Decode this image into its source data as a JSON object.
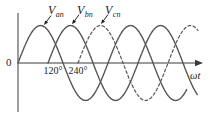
{
  "figure": {
    "background": "#ffffff",
    "origin_label": "0",
    "x_axis_label": "ωt",
    "x_ticks": [
      {
        "label": "120°",
        "theta_deg": 120
      },
      {
        "label": "240°",
        "theta_deg": 240
      }
    ],
    "series_labels": [
      {
        "symbol": "V",
        "subscript": "an"
      },
      {
        "symbol": "V",
        "subscript": "bn"
      },
      {
        "symbol": "V",
        "subscript": "cn"
      }
    ]
  },
  "chart_data": {
    "type": "line",
    "title": "",
    "xlabel": "ωt",
    "ylabel": "",
    "x_unit": "degrees",
    "x_axis_range_deg": [
      0,
      740
    ],
    "y_range": [
      -1,
      1
    ],
    "amplitude": 1,
    "grid": false,
    "x_tick_values_deg": [
      120,
      240
    ],
    "x_tick_labels": [
      "120°",
      "240°"
    ],
    "series": [
      {
        "name": "Van",
        "label": "V_an",
        "value_expression": "sin(wt)",
        "phase_shift_deg": 0,
        "start_deg": 0,
        "end_deg": 675,
        "style": "solid"
      },
      {
        "name": "Vbn",
        "label": "V_bn",
        "value_expression": "sin(wt - 120°)",
        "phase_shift_deg": 120,
        "start_deg": 120,
        "end_deg": 718,
        "style": "solid"
      },
      {
        "name": "Vcn",
        "label": "V_cn",
        "value_expression": "sin(wt - 240°)",
        "phase_shift_deg": 240,
        "start_deg": 240,
        "end_deg": 720,
        "style": "dashed"
      }
    ],
    "annotations": [
      {
        "series": "Van",
        "pointer_theta_deg": 104
      },
      {
        "series": "Vbn",
        "pointer_theta_deg": 216
      },
      {
        "series": "Vcn",
        "pointer_theta_deg": 332
      }
    ],
    "colors": {
      "curve": "#565656",
      "axis": "#3a3a3a",
      "text": "#1f1f1f"
    }
  }
}
